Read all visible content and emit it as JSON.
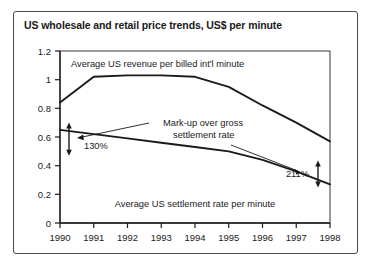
{
  "chart_data": {
    "type": "line",
    "title": "US wholesale and retail price trends, US$ per minute",
    "xlabel": "",
    "ylabel": "",
    "x": [
      1990,
      1991,
      1992,
      1993,
      1994,
      1995,
      1996,
      1997,
      1998
    ],
    "xlim": [
      1990,
      1998
    ],
    "ylim": [
      0,
      1.2
    ],
    "yticks": [
      "0",
      "0.2",
      "0.4",
      "0.6",
      "0.8",
      "1",
      "1.2"
    ],
    "ytick_values": [
      0,
      0.2,
      0.4,
      0.6,
      0.8,
      1.0,
      1.2
    ],
    "xticks": [
      "1990",
      "1991",
      "1992",
      "1993",
      "1994",
      "1995",
      "1996",
      "1997",
      "1998"
    ],
    "grid": false,
    "legend": "inline-labels",
    "series": [
      {
        "name": "Average US revenue per billed int'l minute",
        "values": [
          0.84,
          1.02,
          1.03,
          1.03,
          1.02,
          0.95,
          0.82,
          0.7,
          0.57
        ]
      },
      {
        "name": "Average US settlement rate per minute",
        "values": [
          0.65,
          0.62,
          0.59,
          0.56,
          0.53,
          0.5,
          0.44,
          0.36,
          0.27
        ]
      }
    ],
    "annotations": [
      {
        "name": "markup-1990",
        "label": "130%",
        "at_x": 1990,
        "from_y": 0.65,
        "to_y": 0.84
      },
      {
        "name": "markup-1998",
        "label": "211%",
        "at_x": 1998,
        "from_y": 0.27,
        "to_y": 0.57
      },
      {
        "name": "markup-callout",
        "label_line_1": "Mark-up over gross",
        "label_line_2": "settlement rate"
      }
    ]
  },
  "colors": {
    "line": "#1a1a1a",
    "frame": "#4a4a4a",
    "axis": "#1a1a1a",
    "text": "#1a1a1a",
    "background": "#ffffff"
  }
}
